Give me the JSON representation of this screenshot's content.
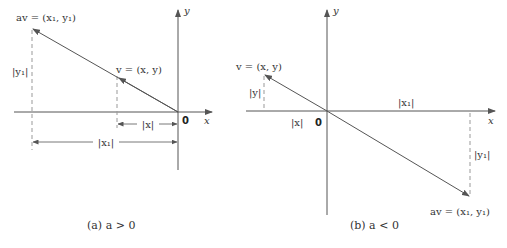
{
  "figure": {
    "panels": [
      {
        "id": "a",
        "caption": "(a)  a > 0",
        "caption_prefix": "(a)",
        "caption_condition": "a > 0",
        "axis_x_label": "x",
        "axis_y_label": "y",
        "origin_label": "0",
        "v_label": "v = (x, y)",
        "av_label": "av = (x₁, y₁)",
        "abs_x_label": "|x|",
        "abs_x1_label": "|x₁|",
        "abs_y1_label": "|y₁|"
      },
      {
        "id": "b",
        "caption": "(b)  a < 0",
        "caption_prefix": "(b)",
        "caption_condition": "a < 0",
        "axis_x_label": "x",
        "axis_y_label": "y",
        "origin_label": "0",
        "v_label": "v = (x, y)",
        "av_label": "av = (x₁, y₁)",
        "abs_x_label": "|x|",
        "abs_x1_label": "|x₁|",
        "abs_y_label": "|y|",
        "abs_y1_label": "|y₁|"
      }
    ],
    "colors": {
      "line": "#555555",
      "dashed": "#999999",
      "text": "#333333"
    }
  }
}
